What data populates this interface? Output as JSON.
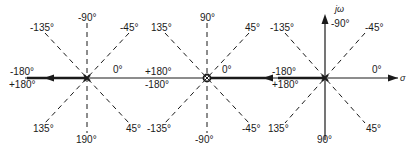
{
  "panels": [
    {
      "id": "left",
      "center_marker": "pole-x",
      "labels": {
        "up": "-90°",
        "down": "190°",
        "upleft": "-135°",
        "upright": "-45°",
        "downleft": "135°",
        "downright": "45°",
        "right": "0°",
        "left_top": "-180°",
        "left_bottom": "+180°"
      }
    },
    {
      "id": "middle",
      "center_marker": "zero-o",
      "labels": {
        "up": "90°",
        "down": "-90°",
        "upleft": "135°",
        "upright": "45°",
        "downleft": "-135°",
        "downright": "-45°",
        "right": "0°",
        "left_top": "+180°",
        "left_bottom": "-180°"
      }
    },
    {
      "id": "right",
      "center_marker": "pole-x",
      "labels": {
        "up": "-90°",
        "down": "90°",
        "upleft": "-135°",
        "upright": "-45°",
        "downleft": "135°",
        "downright": "45°",
        "right": "0°",
        "left_top": "-180°",
        "left_bottom": "+180°"
      },
      "axes": {
        "imag": "jω",
        "real": "σ"
      }
    }
  ],
  "colors": {
    "line": "#1a1a1a",
    "background": "#ffffff"
  }
}
